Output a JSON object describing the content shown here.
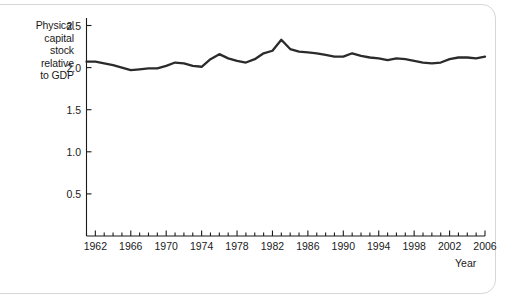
{
  "figure": {
    "name": "physical-capital-stock-chart",
    "background_color": "#ffffff",
    "line_color": "#2b2b2b",
    "axis_color": "#1a1a1a",
    "panel_border_color": "#d6d6d6"
  },
  "axis": {
    "x_name": "Year",
    "y_label_lines": [
      "Physical",
      "capital",
      "stock",
      "relative",
      "to GDP"
    ]
  },
  "chart_data": {
    "type": "line",
    "title": "",
    "subtitle": "",
    "xlabel": "Year",
    "ylabel": "Physical capital stock relative to GDP",
    "xlim": [
      1961,
      2006
    ],
    "ylim": [
      0.0,
      2.62
    ],
    "grid": false,
    "legend": null,
    "y_ticks": [
      0.5,
      1.0,
      1.5,
      2.0,
      2.5
    ],
    "y_tick_labels": [
      "0.5",
      "1.0",
      "1.5",
      "2.0",
      "2.5"
    ],
    "x_ticks": [
      1962,
      1966,
      1970,
      1974,
      1978,
      1982,
      1986,
      1990,
      1994,
      1998,
      2002,
      2006
    ],
    "x_tick_labels": [
      "1962",
      "1966",
      "1970",
      "1974",
      "1978",
      "1982",
      "1986",
      "1990",
      "1994",
      "1998",
      "2002",
      "2006"
    ],
    "x_minor_tick_interval": 1,
    "series": [
      {
        "name": "Physical capital stock relative to GDP",
        "x": [
          1961,
          1962,
          1963,
          1964,
          1965,
          1966,
          1967,
          1968,
          1969,
          1970,
          1971,
          1972,
          1973,
          1974,
          1975,
          1976,
          1977,
          1978,
          1979,
          1980,
          1981,
          1982,
          1983,
          1984,
          1985,
          1986,
          1987,
          1988,
          1989,
          1990,
          1991,
          1992,
          1993,
          1994,
          1995,
          1996,
          1997,
          1998,
          1999,
          2000,
          2001,
          2002,
          2003,
          2004,
          2005,
          2006
        ],
        "values": [
          2.07,
          2.07,
          2.05,
          2.03,
          2.0,
          1.97,
          1.98,
          1.99,
          1.99,
          2.02,
          2.06,
          2.05,
          2.02,
          2.01,
          2.1,
          2.16,
          2.11,
          2.08,
          2.06,
          2.1,
          2.17,
          2.2,
          2.33,
          2.22,
          2.19,
          2.18,
          2.17,
          2.15,
          2.13,
          2.13,
          2.17,
          2.14,
          2.12,
          2.11,
          2.09,
          2.11,
          2.1,
          2.08,
          2.06,
          2.05,
          2.06,
          2.1,
          2.12,
          2.12,
          2.11,
          2.13
        ]
      }
    ]
  }
}
